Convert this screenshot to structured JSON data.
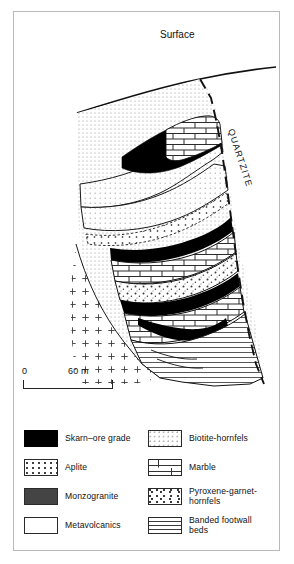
{
  "figure": {
    "type": "geological-cross-section",
    "surface_label": "Surface",
    "host_rock_label": "QUARTZITE"
  },
  "scale": {
    "zero_label": "0",
    "max_label": "60 m"
  },
  "legend": {
    "left_column": [
      {
        "key": "skarn-ore-grade",
        "label": "Skarn–ore grade",
        "pattern": "solid-black",
        "color": "#000000"
      },
      {
        "key": "aplite",
        "label": "Aplite",
        "pattern": "fine-dots",
        "color": "#333333"
      },
      {
        "key": "monzogranite",
        "label": "Monzogranite",
        "pattern": "sparse-crosses",
        "color": "#444444"
      },
      {
        "key": "metavolcanics",
        "label": "Metavolcanics",
        "pattern": "dense-stipple",
        "color": "#777777"
      }
    ],
    "right_column": [
      {
        "key": "biotite-hornfels",
        "label": "Biotite-hornfels",
        "pattern": "light-stipple",
        "color": "#8a8a8a"
      },
      {
        "key": "marble",
        "label": "Marble",
        "pattern": "brick",
        "color": "#333333"
      },
      {
        "key": "pyroxene-garnet-hornfels",
        "label": "Pyroxene-garnet-\nhornfels",
        "pattern": "coarse-speckle",
        "color": "#3a3a3a"
      },
      {
        "key": "banded-footwall-beds",
        "label": "Banded footwall beds",
        "pattern": "horizontal-lines",
        "color": "#3a3a3a"
      }
    ]
  }
}
